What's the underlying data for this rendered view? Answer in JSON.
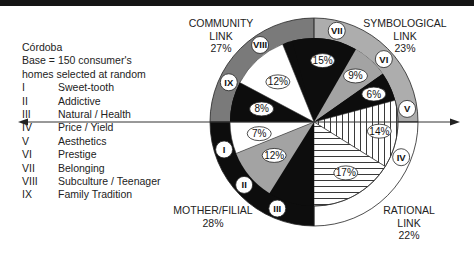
{
  "legend": {
    "city": "Córdoba",
    "base_line1": "Base = 150 consumer's",
    "base_line2": "homes selected at random",
    "items": [
      {
        "numeral": "I",
        "label": "Sweet-tooth"
      },
      {
        "numeral": "II",
        "label": "Addictive"
      },
      {
        "numeral": "III",
        "label": "Natural / Health"
      },
      {
        "numeral": "IV",
        "label": "Price / Yield"
      },
      {
        "numeral": "V",
        "label": "Aesthetics"
      },
      {
        "numeral": "VI",
        "label": "Prestige"
      },
      {
        "numeral": "VII",
        "label": "Belonging"
      },
      {
        "numeral": "VIII",
        "label": "Subculture / Teenager"
      },
      {
        "numeral": "IX",
        "label": "Family Tradition"
      }
    ]
  },
  "chart_data": {
    "type": "pie",
    "title": "",
    "quadrants": [
      {
        "name": "COMMUNITY LINK",
        "line1": "COMMUNITY",
        "line2": "LINK",
        "value": 27,
        "label": "27%",
        "position": "top-left",
        "ring_color": "#7a7a7a",
        "numerals": [
          "VIII",
          "IX"
        ]
      },
      {
        "name": "SYMBOLOGICAL LINK",
        "line1": "SYMBOLOGICAL",
        "line2": "LINK",
        "value": 23,
        "label": "23%",
        "position": "top-right",
        "ring_color": "#adadad",
        "numerals": [
          "VII",
          "VI",
          "V"
        ]
      },
      {
        "name": "RATIONAL LINK",
        "line1": "RATIONAL",
        "line2": "LINK",
        "value": 22,
        "label": "22%",
        "position": "bottom-right",
        "ring_color": "#ffffff",
        "numerals": [
          "IV"
        ]
      },
      {
        "name": "MOTHER/FILIAL",
        "line1": "MOTHER/FILIAL",
        "line2": "",
        "value": 28,
        "label": "28%",
        "position": "bottom-left",
        "ring_color": "#0d0d0d",
        "numerals": [
          "I",
          "II",
          "III"
        ]
      }
    ],
    "slices": [
      {
        "numeral": "VII",
        "value": 15,
        "label": "15%",
        "fill": "black"
      },
      {
        "numeral": "VI",
        "value": 9,
        "label": "9%",
        "fill": "gray"
      },
      {
        "numeral": "V",
        "value": 6,
        "label": "6%",
        "fill": "black"
      },
      {
        "numeral": "IV",
        "value": 14,
        "label": "14%",
        "fill": "vertical-hatch"
      },
      {
        "numeral": "IV",
        "value": 17,
        "label": "17%",
        "fill": "horizontal-hatch"
      },
      {
        "numeral": "III",
        "value": 9,
        "label": "",
        "fill": "black"
      },
      {
        "numeral": "II",
        "value": 12,
        "label": "12%",
        "fill": "gray"
      },
      {
        "numeral": "I",
        "value": 7,
        "label": "7%",
        "fill": "white"
      },
      {
        "numeral": "IX",
        "value": 8,
        "label": "8%",
        "fill": "black"
      },
      {
        "numeral": "VIII",
        "value": 12,
        "label": "12%",
        "fill": "white"
      }
    ],
    "ring_numerals": [
      "I",
      "II",
      "III",
      "IV",
      "V",
      "VI",
      "VII",
      "VIII",
      "IX"
    ],
    "axis": "horizontal double-headed arrow through center",
    "legend_position": "left"
  }
}
